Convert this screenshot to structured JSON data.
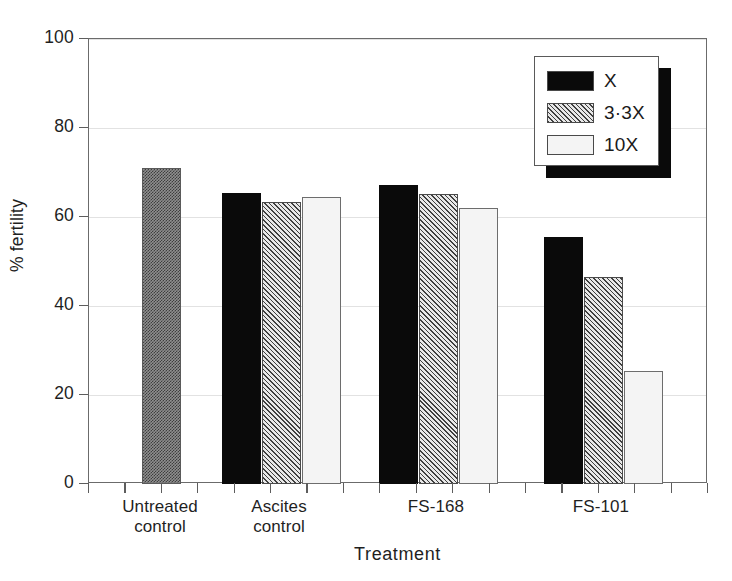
{
  "chart_data": {
    "type": "bar",
    "title": "",
    "xlabel": "Treatment",
    "ylabel": "% fertility",
    "ylim": [
      0,
      100
    ],
    "yticks": [
      0,
      20,
      40,
      60,
      80,
      100
    ],
    "ytick_labels": [
      "0",
      "20",
      "40",
      "60",
      "80",
      "100"
    ],
    "grid": true,
    "legend_position": "top-right",
    "categories": [
      "Untreated control",
      "Ascites control",
      "FS-168",
      "FS-101"
    ],
    "category_labels": [
      "Untreated\ncontrol",
      "Ascites\ncontrol",
      "FS-168",
      "FS-101"
    ],
    "series": [
      {
        "name": "X",
        "pattern": "solid-black",
        "values": [
          null,
          65.3,
          67.2,
          55.6
        ]
      },
      {
        "name": "3·3X",
        "pattern": "diagonal-hatch",
        "values": [
          null,
          63.4,
          65.1,
          46.6
        ]
      },
      {
        "name": "10X",
        "pattern": "light-stipple",
        "values": [
          null,
          64.4,
          62.0,
          25.3
        ]
      }
    ],
    "control_bar": {
      "name": "Untreated control",
      "pattern": "gray-stipple",
      "value": 70.9
    },
    "legend": [
      {
        "label": "X",
        "pattern": "solid-black"
      },
      {
        "label": "3·3X",
        "pattern": "diagonal-hatch"
      },
      {
        "label": "10X",
        "pattern": "light-stipple"
      }
    ],
    "colors": {
      "solid_black": "#0a0a0a",
      "gray_stipple": "#8f8f8f",
      "hatch": "#d2d2d2",
      "light_stipple": "#f4f4f4",
      "frame": "#6b6b6b",
      "gridline": "#e2e2e2",
      "text": "#1f1f1f"
    }
  }
}
